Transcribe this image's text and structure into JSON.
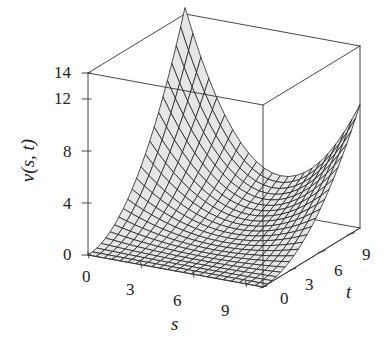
{
  "chart_data": {
    "type": "surface3d",
    "title": "",
    "xlabel": "s",
    "ylabel": "t",
    "zlabel": "v(s, t)",
    "x_ticks": [
      "0",
      "3",
      "6",
      "9"
    ],
    "y_ticks": [
      "0",
      "3",
      "6",
      "9"
    ],
    "z_ticks": [
      "0",
      "4",
      "8",
      "12",
      "14"
    ],
    "x_range": [
      0,
      10
    ],
    "y_range": [
      0,
      10
    ],
    "z_range": [
      0,
      14
    ],
    "grid": false,
    "box": true,
    "style": "wireframe mesh, light gray fill",
    "surface_model": {
      "formula": "v = (t/10)^2 * (A*(1-s/10)^3 + B*(s/10)^3)",
      "A": 14.5,
      "B": 9.5,
      "grid_n": 22
    },
    "sample_values": [
      {
        "s": 0,
        "t": 0,
        "v": 0
      },
      {
        "s": 10,
        "t": 0,
        "v": 0
      },
      {
        "s": 0,
        "t": 10,
        "v": 14.5
      },
      {
        "s": 5,
        "t": 10,
        "v": 3.0
      },
      {
        "s": 10,
        "t": 10,
        "v": 9.5
      },
      {
        "s": 0,
        "t": 5,
        "v": 3.6
      }
    ]
  },
  "projection": {
    "origin": [
      88,
      255
    ],
    "s_axis_end": [
      263,
      287
    ],
    "t_axis_end": [
      185,
      196
    ],
    "z_per_unit": 13.0
  },
  "colors": {
    "line": "#1a1a1a",
    "surface_fill": "#e6e6e6",
    "box": "#333333",
    "text": "#222222"
  },
  "labels": {
    "z_ticks": [
      {
        "text": "14",
        "x": 54,
        "y": 64
      },
      {
        "text": "12",
        "x": 54,
        "y": 90
      },
      {
        "text": "8",
        "x": 63,
        "y": 143
      },
      {
        "text": "4",
        "x": 63,
        "y": 195
      },
      {
        "text": "0",
        "x": 63,
        "y": 246
      }
    ],
    "s_ticks": [
      {
        "text": "0",
        "x": 82,
        "y": 268
      },
      {
        "text": "3",
        "x": 126,
        "y": 281
      },
      {
        "text": "6",
        "x": 173,
        "y": 292
      },
      {
        "text": "9",
        "x": 221,
        "y": 302
      }
    ],
    "t_ticks": [
      {
        "text": "0",
        "x": 280,
        "y": 290
      },
      {
        "text": "3",
        "x": 305,
        "y": 276
      },
      {
        "text": "6",
        "x": 334,
        "y": 262
      },
      {
        "text": "9",
        "x": 362,
        "y": 246
      }
    ],
    "s_title": {
      "text": "s",
      "x": 171,
      "y": 314
    },
    "t_title": {
      "text": "t",
      "x": 346,
      "y": 282
    },
    "z_title": {
      "text": "v(s, t)",
      "x": 6,
      "y": 151
    }
  }
}
